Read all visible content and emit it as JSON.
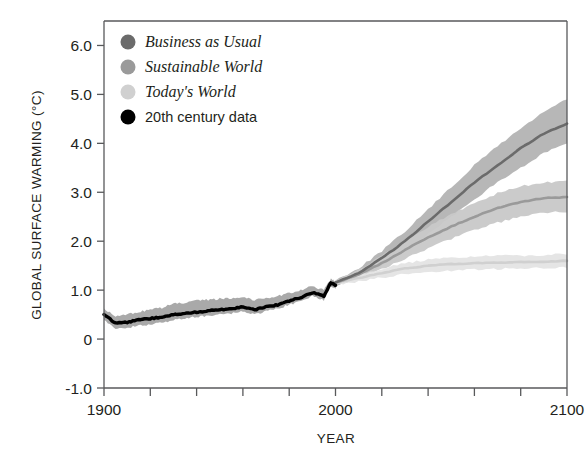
{
  "chart_data": {
    "type": "line",
    "title": "",
    "xlabel": "YEAR",
    "ylabel": "GLOBAL SURFACE WARMING (°C)",
    "xlim": [
      1900,
      2100
    ],
    "ylim": [
      -1.0,
      6.5
    ],
    "xticks": [
      1900,
      1920,
      1940,
      1960,
      1980,
      2000,
      2020,
      2040,
      2060,
      2080,
      2100
    ],
    "xticklabels": [
      "1900",
      "",
      "",
      "",
      "",
      "2000",
      "",
      "",
      "",
      "",
      "2100"
    ],
    "yticks": [
      -1.0,
      0,
      1.0,
      2.0,
      3.0,
      4.0,
      5.0,
      6.0
    ],
    "yticklabels": [
      "-1.0",
      "0",
      "1.0",
      "2.0",
      "3.0",
      "4.0",
      "5.0",
      "6.0"
    ],
    "grid": false,
    "legend_position": "top-left",
    "bands": "shaded uncertainty range around each series",
    "series": [
      {
        "name": "Business as Usual",
        "color": "#6b6b6b",
        "band_color": "#b3b3b3",
        "style": "italic-legend",
        "x": [
          2000,
          2010,
          2020,
          2030,
          2040,
          2050,
          2060,
          2070,
          2080,
          2090,
          2100
        ],
        "values": [
          1.15,
          1.35,
          1.65,
          2.0,
          2.4,
          2.8,
          3.2,
          3.55,
          3.9,
          4.2,
          4.4
        ],
        "band_low": [
          1.1,
          1.25,
          1.5,
          1.8,
          2.15,
          2.5,
          2.85,
          3.2,
          3.5,
          3.8,
          4.0
        ],
        "band_high": [
          1.2,
          1.45,
          1.8,
          2.2,
          2.65,
          3.1,
          3.55,
          3.95,
          4.3,
          4.65,
          4.9
        ]
      },
      {
        "name": "Sustainable World",
        "color": "#9a9a9a",
        "band_color": "#c8c8c8",
        "style": "italic-legend",
        "x": [
          2000,
          2010,
          2020,
          2030,
          2040,
          2050,
          2060,
          2070,
          2080,
          2090,
          2100
        ],
        "values": [
          1.15,
          1.32,
          1.55,
          1.82,
          2.08,
          2.3,
          2.5,
          2.68,
          2.8,
          2.88,
          2.9
        ],
        "band_low": [
          1.1,
          1.24,
          1.42,
          1.64,
          1.86,
          2.05,
          2.22,
          2.38,
          2.5,
          2.58,
          2.6
        ],
        "band_high": [
          1.2,
          1.42,
          1.7,
          2.0,
          2.3,
          2.55,
          2.78,
          2.98,
          3.12,
          3.2,
          3.22
        ]
      },
      {
        "name": "Today's World",
        "color": "#d0d0d0",
        "band_color": "#e4e4e4",
        "style": "italic-legend",
        "x": [
          2000,
          2010,
          2020,
          2030,
          2040,
          2050,
          2060,
          2070,
          2080,
          2090,
          2100
        ],
        "values": [
          1.15,
          1.25,
          1.35,
          1.44,
          1.5,
          1.53,
          1.55,
          1.56,
          1.57,
          1.58,
          1.6
        ],
        "band_low": [
          1.1,
          1.18,
          1.26,
          1.33,
          1.38,
          1.4,
          1.42,
          1.43,
          1.44,
          1.45,
          1.46
        ],
        "band_high": [
          1.2,
          1.32,
          1.44,
          1.55,
          1.62,
          1.66,
          1.69,
          1.7,
          1.71,
          1.72,
          1.74
        ]
      },
      {
        "name": "20th century data",
        "color": "#000000",
        "band_color": "#9a9a9a",
        "style": "plain-legend",
        "x": [
          1900,
          1905,
          1910,
          1915,
          1920,
          1925,
          1930,
          1935,
          1940,
          1945,
          1950,
          1955,
          1960,
          1965,
          1970,
          1975,
          1980,
          1985,
          1990,
          1995,
          1998,
          2000
        ],
        "values": [
          0.5,
          0.32,
          0.34,
          0.4,
          0.42,
          0.45,
          0.5,
          0.52,
          0.55,
          0.58,
          0.6,
          0.62,
          0.66,
          0.6,
          0.66,
          0.7,
          0.78,
          0.85,
          0.95,
          0.88,
          1.15,
          1.1
        ],
        "band_low": [
          0.38,
          0.2,
          0.22,
          0.28,
          0.3,
          0.33,
          0.4,
          0.42,
          0.45,
          0.48,
          0.5,
          0.52,
          0.56,
          0.5,
          0.57,
          0.62,
          0.7,
          0.78,
          0.88,
          0.8,
          1.08,
          1.03
        ],
        "band_high": [
          0.62,
          0.46,
          0.5,
          0.56,
          0.6,
          0.64,
          0.72,
          0.74,
          0.78,
          0.8,
          0.82,
          0.84,
          0.86,
          0.8,
          0.84,
          0.88,
          0.94,
          1.0,
          1.08,
          1.0,
          1.22,
          1.18
        ]
      }
    ]
  },
  "legend": {
    "items": [
      {
        "label": "Business as Usual",
        "color": "#6b6b6b"
      },
      {
        "label": "Sustainable World",
        "color": "#9a9a9a"
      },
      {
        "label": "Today's World",
        "color": "#d0d0d0"
      },
      {
        "label": "20th century data",
        "color": "#000000"
      }
    ]
  },
  "axes": {
    "y_title": "GLOBAL SURFACE WARMING (°C)",
    "x_title": "YEAR",
    "y_labels": [
      "6.0",
      "5.0",
      "4.0",
      "3.0",
      "2.0",
      "1.0",
      "0",
      "-1.0"
    ],
    "x_labels": [
      "1900",
      "2000",
      "2100"
    ]
  }
}
